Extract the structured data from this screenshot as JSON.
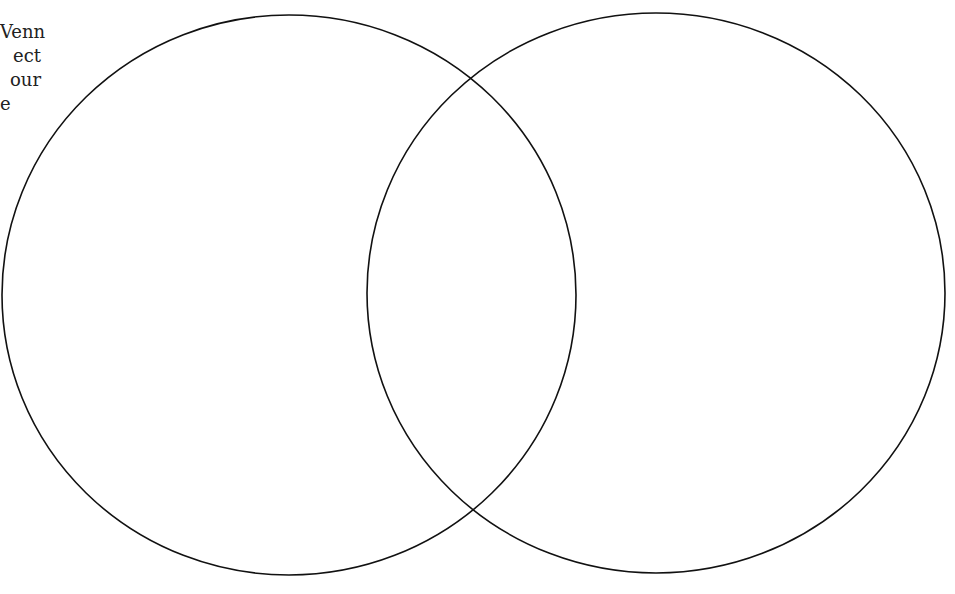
{
  "intro_text": {
    "lines": [
      "Venn",
      "ect",
      "our",
      "e"
    ],
    "note": "partially cropped text at left edge"
  },
  "venn": {
    "stroke_color": "#111111",
    "fill_color": "#ffffff",
    "circles": [
      {
        "name": "left",
        "cx": 289,
        "cy": 295,
        "rx": 287,
        "ry": 280,
        "label": ""
      },
      {
        "name": "right",
        "cx": 656,
        "cy": 293,
        "rx": 289,
        "ry": 280,
        "label": ""
      }
    ]
  }
}
